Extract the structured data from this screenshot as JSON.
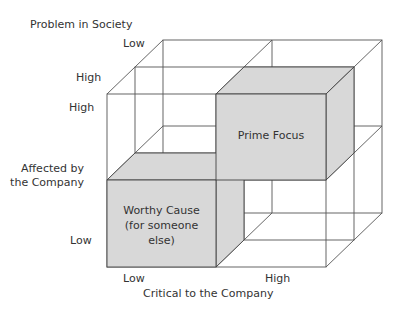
{
  "diagram": {
    "axes": {
      "depth": {
        "title": "Problem in Society",
        "tick_back": "Low",
        "tick_front": "High"
      },
      "vertical": {
        "title_line1": "Affected by",
        "title_line2": "the Company",
        "tick_top": "High",
        "tick_bottom": "Low"
      },
      "horizontal": {
        "title": "Critical to the Company",
        "tick_left": "Low",
        "tick_right": "High"
      }
    },
    "boxes": {
      "prime_focus": {
        "label": "Prime Focus"
      },
      "worthy_cause": {
        "line1": "Worthy Cause",
        "line2": "(for someone",
        "line3": "else)"
      }
    },
    "colors": {
      "shade": "#d8d8d8",
      "line": "#444444",
      "text": "#333333"
    }
  }
}
